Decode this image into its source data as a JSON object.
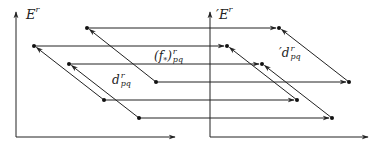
{
  "diagram": {
    "left_panel": {
      "axis_label": "E",
      "axis_label_sup": "r",
      "differential_label": "d",
      "differential_sup": "r",
      "differential_sub": "pq"
    },
    "right_panel": {
      "axis_label": "′E",
      "axis_label_sup": "r",
      "differential_label": "′d",
      "differential_sup": "r",
      "differential_sub": "pq"
    },
    "induced_map_label": "(f",
    "induced_map_star": "*",
    "induced_map_close": ")",
    "induced_map_sup": "r",
    "induced_map_sub": "pq",
    "colors": {
      "stroke": "#222222",
      "background": "#ffffff"
    },
    "left_points": [
      [
        87,
        28
      ],
      [
        34,
        46
      ],
      [
        69,
        64
      ],
      [
        156,
        82
      ],
      [
        104,
        100
      ],
      [
        139,
        118
      ]
    ],
    "right_points": [
      [
        279,
        28
      ],
      [
        227,
        46
      ],
      [
        262,
        64
      ],
      [
        349,
        82
      ],
      [
        297,
        100
      ],
      [
        332,
        118
      ]
    ],
    "differentials": [
      [
        3,
        0
      ],
      [
        4,
        1
      ],
      [
        5,
        2
      ]
    ]
  }
}
